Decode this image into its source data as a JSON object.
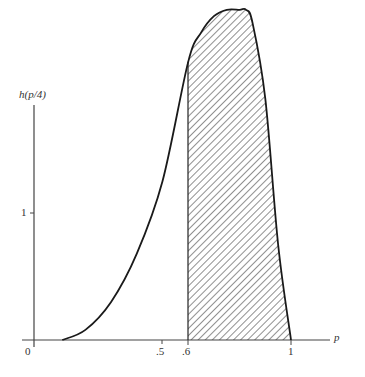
{
  "chart_data": {
    "type": "area",
    "title": "",
    "xlabel": "p",
    "ylabel": "h(p/4)",
    "x_ticks": [
      {
        "value": 0,
        "label": "0"
      },
      {
        "value": 0.5,
        "label": ".5"
      },
      {
        "value": 0.6,
        "label": ".6"
      },
      {
        "value": 1,
        "label": "1"
      }
    ],
    "y_ticks": [
      {
        "value": 1,
        "label": "1"
      }
    ],
    "xlim": [
      0,
      1.15
    ],
    "ylim": [
      0,
      2.65
    ],
    "grid": false,
    "legend": null,
    "series": [
      {
        "name": "h(p/4)",
        "x": [
          0.11,
          0.2,
          0.3,
          0.4,
          0.5,
          0.6,
          0.65,
          0.7,
          0.75,
          0.8,
          0.825,
          0.85,
          0.9,
          0.95,
          1.0
        ],
        "values": [
          0.0,
          0.08,
          0.3,
          0.68,
          1.25,
          2.19,
          2.42,
          2.55,
          2.6,
          2.6,
          2.6,
          2.5,
          1.9,
          0.75,
          0.0
        ]
      }
    ],
    "shaded_region": {
      "from": 0.6,
      "to": 1.0,
      "pattern": "diagonal-hatch"
    }
  }
}
